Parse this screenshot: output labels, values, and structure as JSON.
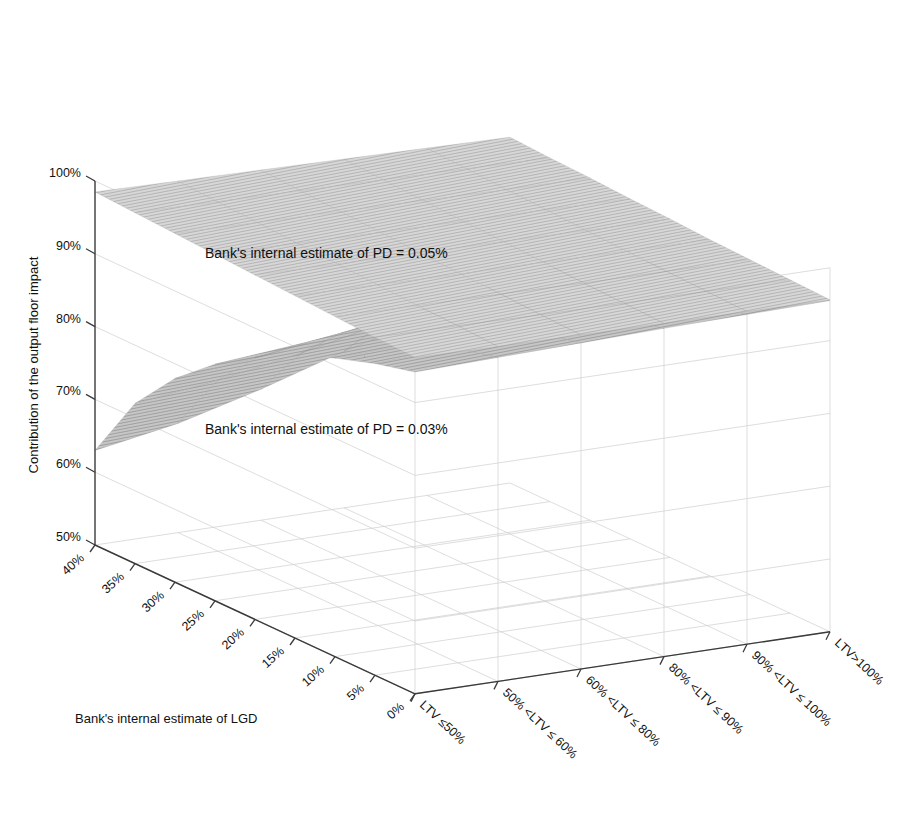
{
  "chart_data": {
    "type": "surface",
    "title": "",
    "xlabel": "Bank's internal estimate of LGD",
    "ylabel": "",
    "zlabel": "Contribution of the output floor impact",
    "x_ticks": [
      "40%",
      "35%",
      "30%",
      "25%",
      "20%",
      "15%",
      "10%",
      "5%",
      "0%"
    ],
    "x_values": [
      40,
      35,
      30,
      25,
      20,
      15,
      10,
      5,
      0
    ],
    "y_categories": [
      "LTV ≤50%",
      "50% <LTV ≤ 60%",
      "60% <LTV ≤ 80%",
      "80% <LTV ≤ 90%",
      "90% <LTV ≤ 100%",
      "LTV>100%"
    ],
    "z_ticks": [
      "50%",
      "60%",
      "70%",
      "80%",
      "90%",
      "100%"
    ],
    "z_values": [
      50,
      60,
      70,
      80,
      90,
      100
    ],
    "zlim": [
      50,
      100
    ],
    "grid": true,
    "legend": "none",
    "annotations": [
      {
        "text": "Bank's internal estimate of PD = 0.05%",
        "series": "pd005"
      },
      {
        "text": "Bank's internal estimate of PD = 0.03%",
        "series": "pd003"
      }
    ],
    "series": [
      {
        "name": "Bank's internal estimate of PD = 0.05%",
        "pd": "0.05%",
        "color": "#d2d2d2",
        "edge_color": "#9e9e9e",
        "z_by_ltv": [
          {
            "ltv": "LTV ≤50%",
            "values": [
              98.5,
              98.2,
              97.9,
              97.6,
              97.3,
              97.0,
              96.7,
              96.4,
              96.2
            ]
          },
          {
            "ltv": "50% <LTV ≤ 60%",
            "values": [
              98.3,
              98.0,
              97.7,
              97.4,
              97.1,
              96.8,
              96.5,
              96.3,
              96.0
            ]
          },
          {
            "ltv": "60% <LTV ≤ 80%",
            "values": [
              98.1,
              97.8,
              97.5,
              97.2,
              96.9,
              96.6,
              96.4,
              96.1,
              95.9
            ]
          },
          {
            "ltv": "80% <LTV ≤ 90%",
            "values": [
              97.9,
              97.6,
              97.3,
              97.0,
              96.8,
              96.5,
              96.2,
              96.0,
              95.8
            ]
          },
          {
            "ltv": "90% <LTV ≤ 100%",
            "values": [
              97.7,
              97.4,
              97.1,
              96.9,
              96.6,
              96.3,
              96.1,
              95.9,
              95.7
            ]
          },
          {
            "ltv": "LTV>100%",
            "values": [
              97.5,
              97.2,
              97.0,
              96.7,
              96.5,
              96.2,
              96.0,
              95.8,
              95.6
            ]
          }
        ]
      },
      {
        "name": "Bank's internal estimate of PD = 0.03%",
        "pd": "0.03%",
        "color": "#b9b9b9",
        "edge_color": "#8a8a8a",
        "z_by_ltv": [
          {
            "ltv": "LTV ≤50%",
            "values": [
              63.0,
              72.0,
              78.0,
              82.5,
              86.0,
              88.8,
              91.0,
              92.8,
              94.2
            ]
          },
          {
            "ltv": "50% <LTV ≤ 60%",
            "values": [
              65.0,
              73.5,
              79.2,
              83.5,
              86.8,
              89.4,
              91.5,
              93.2,
              94.5
            ]
          },
          {
            "ltv": "60% <LTV ≤ 80%",
            "values": [
              68.0,
              75.5,
              80.8,
              84.8,
              87.8,
              90.2,
              92.1,
              93.6,
              94.8
            ]
          },
          {
            "ltv": "80% <LTV ≤ 90%",
            "values": [
              71.5,
              78.0,
              82.6,
              86.1,
              88.8,
              91.0,
              92.7,
              94.0,
              95.1
            ]
          },
          {
            "ltv": "90% <LTV ≤ 100%",
            "values": [
              74.5,
              80.2,
              84.2,
              87.3,
              89.7,
              91.6,
              93.1,
              94.3,
              95.3
            ]
          },
          {
            "ltv": "LTV>100%",
            "values": [
              77.0,
              82.0,
              85.6,
              88.3,
              90.4,
              92.1,
              93.5,
              94.6,
              95.5
            ]
          }
        ]
      }
    ]
  },
  "axes": {
    "x_axis_title": "Bank's internal estimate of LGD",
    "z_axis_title": "Contribution of the output floor impact"
  }
}
